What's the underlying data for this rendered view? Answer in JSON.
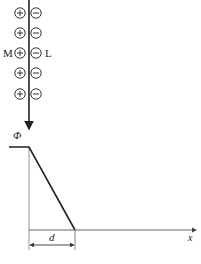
{
  "diagram": {
    "labels": {
      "left_plate": "M",
      "right_plate": "L",
      "potential": "Φ",
      "thickness": "d",
      "x_axis": "x"
    },
    "charges": {
      "rows": 5,
      "left_symbol": "+",
      "right_symbol": "−",
      "row_y": [
        13,
        33,
        53,
        73,
        94
      ]
    },
    "geometry": {
      "boundary_x": 29,
      "plateau_y": 147,
      "slope_end_x": 75,
      "axis_y": 230
    },
    "colors": {
      "line": "#222222",
      "axis": "#777777"
    }
  }
}
